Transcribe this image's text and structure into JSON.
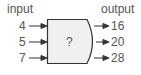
{
  "diagram": {
    "input_label": "input",
    "output_label": "output",
    "box_label": "?",
    "inputs": [
      "4",
      "5",
      "7"
    ],
    "outputs": [
      "16",
      "20",
      "28"
    ],
    "colors": {
      "box_fill": "#f0f0f0",
      "stroke": "#333333",
      "text": "#555555"
    }
  }
}
